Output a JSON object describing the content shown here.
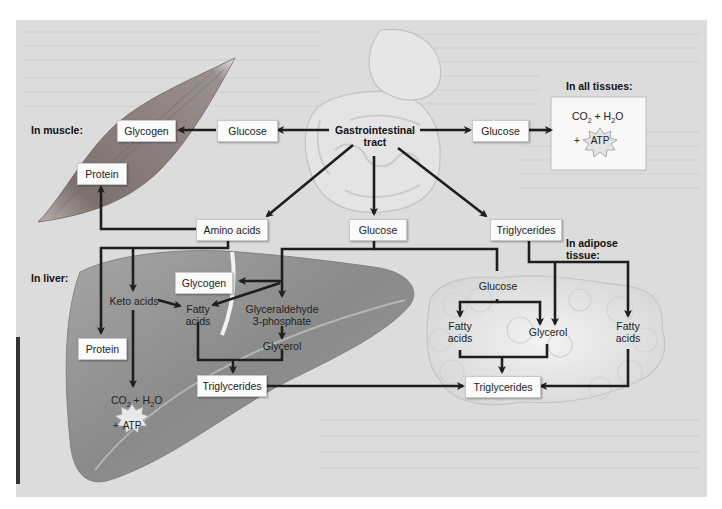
{
  "diagram": {
    "regions": {
      "muscle": "In muscle:",
      "liver": "In liver:",
      "all_tissues": "In all tissues:",
      "adipose_line1": "In adipose",
      "adipose_line2": "tissue:"
    },
    "source": {
      "line1": "Gastrointestinal",
      "line2": "tract"
    },
    "gi_outputs": {
      "glucose_left": "Glucose",
      "glucose_right": "Glucose",
      "glucose_center": "Glucose",
      "amino_acids": "Amino acids",
      "triglycerides": "Triglycerides"
    },
    "muscle": {
      "glycogen": "Glycogen",
      "protein": "Protein"
    },
    "all_tissues": {
      "co2": "CO",
      "co2_sub": "2",
      "plus": " + H",
      "h2o_sub": "2",
      "o": "O",
      "atp_plus": "+",
      "atp": "ATP"
    },
    "liver": {
      "keto_acids": "Keto acids",
      "glycogen": "Glycogen",
      "fatty_acids_line1": "Fatty",
      "fatty_acids_line2": "acids",
      "g3p_line1": "Glyceraldehyde",
      "g3p_line2": "3-phosphate",
      "glycerol": "Glycerol",
      "protein": "Protein",
      "triglycerides": "Triglycerides",
      "co2": "CO",
      "co2_sub": "2",
      "plus": " + H",
      "h2o_sub": "2",
      "o": "O",
      "atp_plus": "+",
      "atp": "ATP"
    },
    "adipose": {
      "glucose": "Glucose",
      "fatty_acids_left_line1": "Fatty",
      "fatty_acids_left_line2": "acids",
      "glycerol": "Glycerol",
      "fatty_acids_right_line1": "Fatty",
      "fatty_acids_right_line2": "acids",
      "triglycerides": "Triglycerides"
    },
    "colors": {
      "background": "#dcdcdc",
      "arrow": "#1e1e1e",
      "box": "#fbfbfb",
      "muscle": "#8a7f7c",
      "liver": "#8d8d8d",
      "adipose": "#ececec"
    }
  }
}
